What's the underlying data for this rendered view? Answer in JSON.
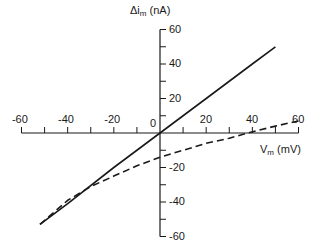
{
  "chart_data": {
    "type": "line",
    "title": "",
    "xlabel": "V_m (mV)",
    "ylabel": "Δi_m (nA)",
    "xlabel_parts": {
      "main": "V",
      "sub": "m",
      "rest": " (mV)"
    },
    "ylabel_parts": {
      "main": "Δi",
      "sub": "m",
      "rest": " (nA)"
    },
    "xlim": [
      -60,
      60
    ],
    "ylim": [
      -60,
      60
    ],
    "x_ticks": [
      -60,
      -40,
      -20,
      0,
      20,
      40,
      60
    ],
    "x_minor_ticks": [
      -50,
      -30,
      -10,
      10,
      30,
      50
    ],
    "y_ticks": [
      60,
      40,
      20,
      -20,
      -40,
      -60
    ],
    "y_minor_ticks": [
      50,
      30,
      10,
      -10,
      -30,
      -50
    ],
    "origin_label": "0",
    "grid": false,
    "legend": null,
    "axes_style": "cross-at-origin",
    "series": [
      {
        "name": "solid",
        "style": "solid",
        "color": "#1a1a1a",
        "x": [
          -52,
          -40,
          -20,
          0,
          20,
          40,
          50
        ],
        "y": [
          -53,
          -41,
          -20,
          0,
          20,
          40,
          50
        ]
      },
      {
        "name": "dashed",
        "style": "dashed",
        "color": "#1a1a1a",
        "x": [
          -52,
          -40,
          -30,
          -20,
          -10,
          0,
          10,
          20,
          30,
          38,
          50,
          60
        ],
        "y": [
          -53,
          -39,
          -31,
          -25,
          -19,
          -14,
          -10,
          -6,
          -3,
          0,
          4,
          7
        ]
      }
    ]
  }
}
